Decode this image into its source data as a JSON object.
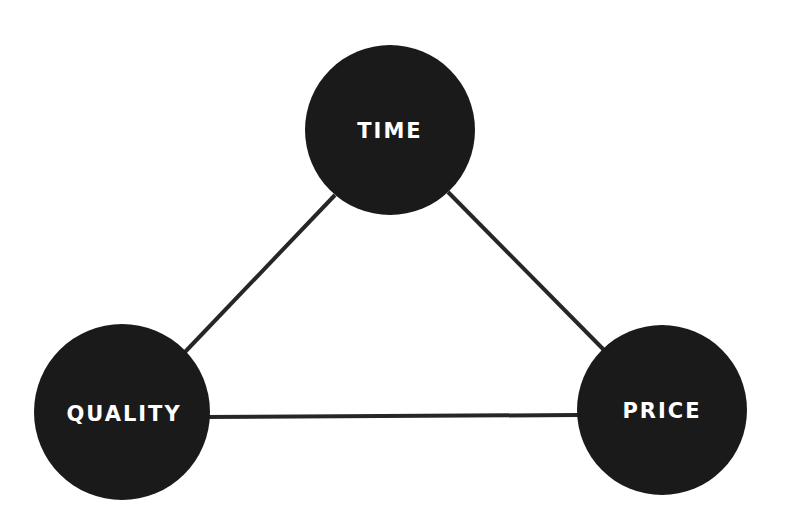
{
  "diagram": {
    "type": "triangle-tradeoff",
    "nodes": [
      {
        "id": "time",
        "label": "TIME"
      },
      {
        "id": "quality",
        "label": "QUALITY"
      },
      {
        "id": "price",
        "label": "PRICE"
      }
    ],
    "edges": [
      {
        "from": "time",
        "to": "quality"
      },
      {
        "from": "time",
        "to": "price"
      },
      {
        "from": "quality",
        "to": "price"
      }
    ],
    "colors": {
      "node_fill": "#1a1a1a",
      "edge": "#262626",
      "label": "#ffffff",
      "background": "#ffffff"
    }
  }
}
